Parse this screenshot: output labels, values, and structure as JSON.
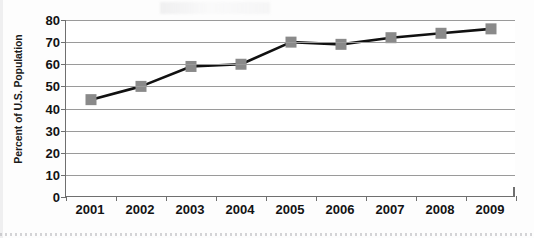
{
  "chart_data": {
    "type": "line",
    "title": "",
    "subtitle": "",
    "xlabel": "",
    "ylabel": "Percent of U.S. Population",
    "categories": [
      "2001",
      "2002",
      "2003",
      "2004",
      "2005",
      "2006",
      "2007",
      "2008",
      "2009"
    ],
    "values": [
      44,
      50,
      59,
      60,
      70,
      69,
      72,
      74,
      76
    ],
    "series": [
      {
        "name": "Percent of U.S. Population",
        "values": [
          44,
          50,
          59,
          60,
          70,
          69,
          72,
          74,
          76
        ]
      }
    ],
    "ylim": [
      0,
      80
    ],
    "y_ticks": [
      0,
      10,
      20,
      30,
      40,
      50,
      60,
      70,
      80
    ],
    "y_tick_labels": [
      "0",
      "10",
      "20",
      "30",
      "40",
      "50",
      "60",
      "70",
      "80"
    ],
    "grid": true,
    "grid_axis": "y",
    "legend": false,
    "legend_position": "none",
    "marker": "square",
    "marker_color": "#8a8a8a",
    "line_color": "#111111",
    "gridline_color": "#9a9a9a",
    "axis_color": "#6f6f6f",
    "background_color": "#ffffff",
    "text_color": "#131313"
  },
  "axes": {
    "y_title": "Percent of U.S. Population"
  }
}
